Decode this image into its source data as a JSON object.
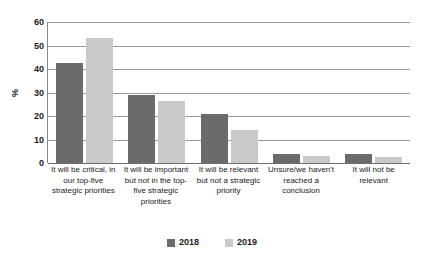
{
  "chart_data": {
    "type": "bar",
    "title": "",
    "xlabel": "",
    "ylabel": "%",
    "ylim": [
      0,
      60
    ],
    "yticks": [
      0,
      10,
      20,
      30,
      40,
      50,
      60
    ],
    "grid": true,
    "legend_position": "bottom",
    "categories": [
      "It will be critical, in our top-five strategic priorities",
      "It will be important but not in the top-five strategic priorities",
      "It will be relevant but not a strategic priority",
      "Unsure/we haven't reached a conclusion",
      "It will not be relevant"
    ],
    "series": [
      {
        "name": "2018",
        "color": "#6b6b6b",
        "values": [
          42.5,
          29,
          21,
          4,
          4
        ]
      },
      {
        "name": "2019",
        "color": "#cacaca",
        "values": [
          53,
          26.5,
          14,
          3,
          2.5
        ]
      }
    ]
  },
  "legend": {
    "items": [
      {
        "label": "2018",
        "color": "#6b6b6b"
      },
      {
        "label": "2019",
        "color": "#cacaca"
      }
    ]
  }
}
